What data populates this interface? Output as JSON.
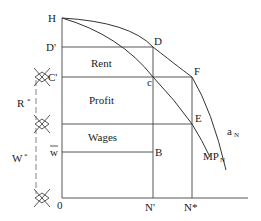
{
  "diagram": {
    "type": "economics-distribution-diagram",
    "axis_labels": {
      "origin": "0",
      "top": "H",
      "d_prime": "D'",
      "c_prime": "C'",
      "w_bar": "w",
      "n_prime": "N'",
      "n_star": "N*"
    },
    "point_labels": {
      "D": "D",
      "c": "c",
      "F": "F",
      "E": "E",
      "B": "B"
    },
    "region_labels": {
      "rent": "Rent",
      "profit": "Profit",
      "wages": "Wages"
    },
    "bracket_labels": {
      "r_star": "R",
      "r_star_mark": "*",
      "w_star": "W",
      "w_star_mark": "*"
    },
    "curve_labels": {
      "average_product": "a",
      "average_product_sub": "N",
      "marginal_product": "MP",
      "marginal_product_sub": "N"
    },
    "colors": {
      "line": "#444444",
      "text": "#222222",
      "background": "#ffffff"
    }
  }
}
